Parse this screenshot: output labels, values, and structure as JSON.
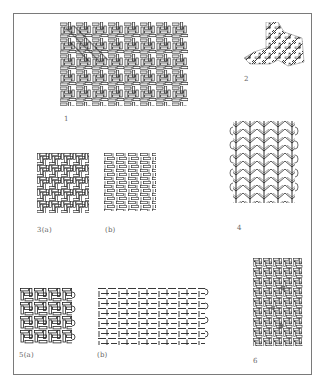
{
  "plate": {
    "description": "Plate of basketry / textile weave structure illustrations",
    "figures": [
      {
        "id": "fig1",
        "label": "1",
        "type": "twill-weave-large"
      },
      {
        "id": "fig2",
        "label": "2",
        "type": "twill-fragment"
      },
      {
        "id": "fig3a",
        "label": "3(a)",
        "type": "twill-weave-square"
      },
      {
        "id": "fig3b",
        "label": "(b)",
        "type": "diagonal-twill-square"
      },
      {
        "id": "fig4",
        "label": "4",
        "type": "chevron-twined-rows"
      },
      {
        "id": "fig5a",
        "label": "5(a)",
        "type": "twill-weave-selvedge"
      },
      {
        "id": "fig5b",
        "label": "(b)",
        "type": "open-twill-diagram"
      },
      {
        "id": "fig6",
        "label": "6",
        "type": "dense-twill-panel"
      }
    ]
  },
  "colors": {
    "ink": "#2a2a2a",
    "border": "#7a7a7a",
    "paper": "#ffffff"
  }
}
